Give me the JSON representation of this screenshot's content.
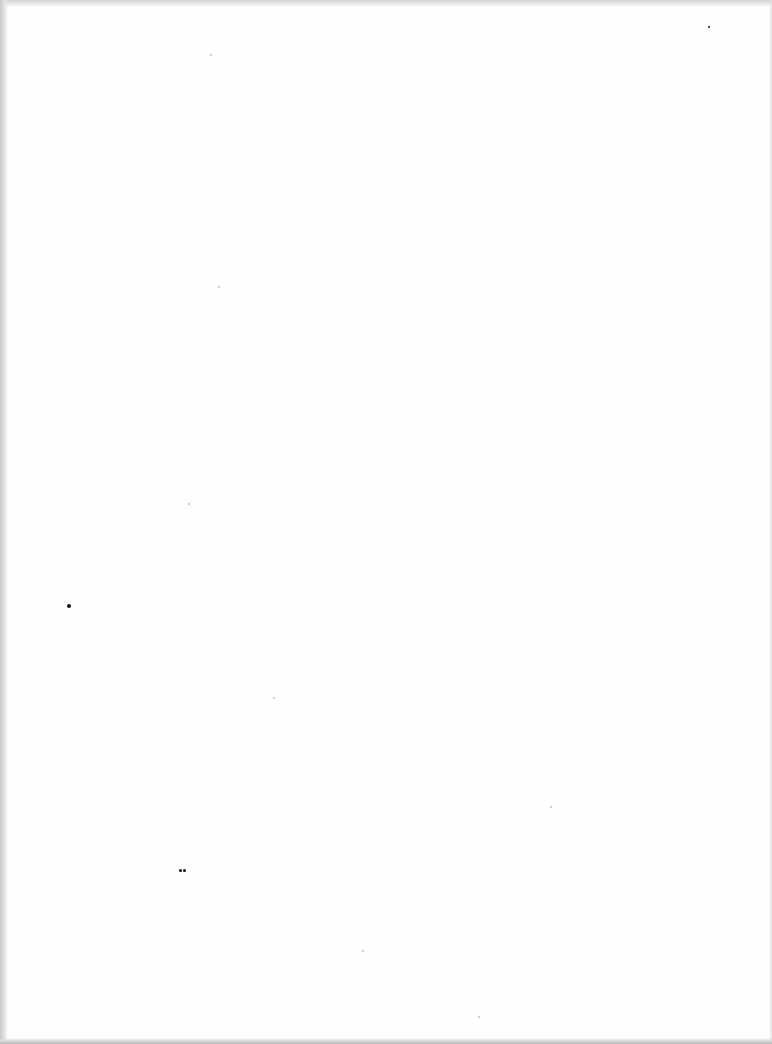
{
  "document": {
    "type": "blank scanned page",
    "text": ""
  },
  "specks": [
    {
      "x": 67,
      "y": 604,
      "size": 4,
      "faint": false
    },
    {
      "x": 179,
      "y": 869,
      "size": 3,
      "faint": false
    },
    {
      "x": 183,
      "y": 869,
      "size": 3,
      "faint": false
    },
    {
      "x": 708,
      "y": 26,
      "size": 2,
      "faint": false
    },
    {
      "x": 218,
      "y": 286,
      "size": 2,
      "faint": true
    },
    {
      "x": 188,
      "y": 503,
      "size": 2,
      "faint": true
    },
    {
      "x": 550,
      "y": 806,
      "size": 2,
      "faint": true
    },
    {
      "x": 273,
      "y": 697,
      "size": 2,
      "faint": true
    },
    {
      "x": 362,
      "y": 950,
      "size": 2,
      "faint": true
    },
    {
      "x": 210,
      "y": 54,
      "size": 2,
      "faint": true
    },
    {
      "x": 478,
      "y": 1016,
      "size": 2,
      "faint": true
    }
  ]
}
